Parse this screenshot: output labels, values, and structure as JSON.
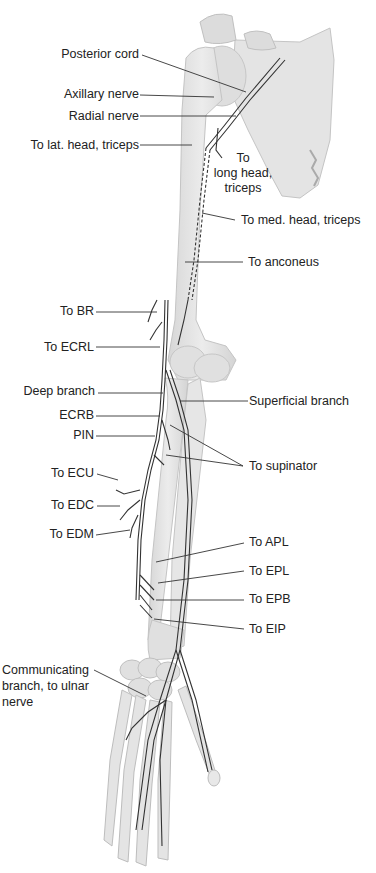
{
  "figure": {
    "colors": {
      "bone_fill": "#e2e2e2",
      "bone_stroke": "#bdbdbd",
      "nerve_stroke": "#333333",
      "leader_line": "#333333",
      "background": "#ffffff"
    },
    "labels": {
      "posterior_cord": "Posterior cord",
      "axillary_nerve": "Axillary nerve",
      "radial_nerve": "Radial nerve",
      "to_lat_head_triceps": "To lat. head, triceps",
      "to_long_head_triceps_1": "To",
      "to_long_head_triceps_2": "long head,",
      "to_long_head_triceps_3": "triceps",
      "to_med_head_triceps": "To med. head, triceps",
      "to_anconeus": "To anconeus",
      "to_br": "To BR",
      "to_ecrl": "To ECRL",
      "deep_branch": "Deep branch",
      "superficial_branch": "Superficial branch",
      "ecrb": "ECRB",
      "pin": "PIN",
      "to_supinator": "To supinator",
      "to_ecu": "To ECU",
      "to_edc": "To EDC",
      "to_edm": "To EDM",
      "to_apl": "To APL",
      "to_epl": "To EPL",
      "to_epb": "To EPB",
      "to_eip": "To EIP",
      "communicating_branch_1": "Communicating",
      "communicating_branch_2": "branch, to ulnar",
      "communicating_branch_3": "nerve"
    }
  }
}
